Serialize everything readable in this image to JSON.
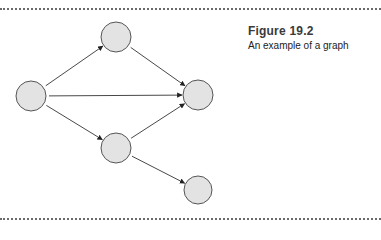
{
  "figure": {
    "label": "Figure 19.2",
    "caption": "An example of a graph"
  },
  "colors": {
    "node_fill": "#e3e3e3",
    "node_stroke": "#555555",
    "edge": "#333333",
    "rule": "#6a6a6a"
  },
  "graph": {
    "directed": true,
    "nodes": [
      {
        "id": "A",
        "x": 31,
        "y": 96,
        "r": 15
      },
      {
        "id": "B",
        "x": 116,
        "y": 37,
        "r": 15
      },
      {
        "id": "C",
        "x": 198,
        "y": 95,
        "r": 15
      },
      {
        "id": "D",
        "x": 116,
        "y": 148,
        "r": 15
      },
      {
        "id": "E",
        "x": 198,
        "y": 190,
        "r": 14
      }
    ],
    "edges": [
      {
        "from": "A",
        "to": "B"
      },
      {
        "from": "A",
        "to": "C"
      },
      {
        "from": "A",
        "to": "D"
      },
      {
        "from": "B",
        "to": "C"
      },
      {
        "from": "D",
        "to": "C"
      },
      {
        "from": "D",
        "to": "E"
      }
    ]
  }
}
